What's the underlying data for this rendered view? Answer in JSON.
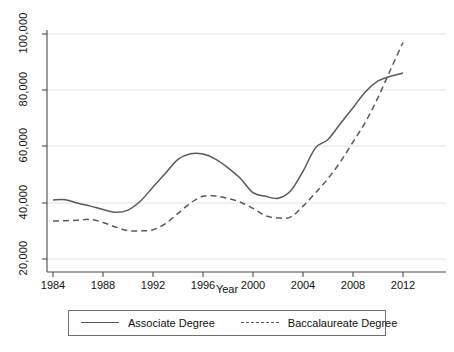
{
  "chart_data": {
    "type": "line",
    "title": "",
    "subtitle": "",
    "xlabel": "Year",
    "ylabel": "",
    "xlim": [
      1984,
      2012
    ],
    "ylim": [
      20000,
      100000
    ],
    "grid": true,
    "legend_position": "bottom",
    "x_ticks": [
      "1984",
      "1988",
      "1992",
      "1996",
      "2000",
      "2004",
      "2008",
      "2012"
    ],
    "x_tick_values": [
      1984,
      1988,
      1992,
      1996,
      2000,
      2004,
      2008,
      2012
    ],
    "y_ticks": [
      "20,000",
      "40,000",
      "60,000",
      "80,000",
      "100,000"
    ],
    "y_tick_values": [
      20000,
      40000,
      60000,
      80000,
      100000
    ],
    "x": [
      1984,
      1985,
      1986,
      1987,
      1988,
      1989,
      1990,
      1991,
      1992,
      1993,
      1994,
      1995,
      1996,
      1997,
      1998,
      1999,
      2000,
      2001,
      2002,
      2003,
      2004,
      2005,
      2006,
      2007,
      2008,
      2009,
      2010,
      2011,
      2012
    ],
    "series": [
      {
        "name": "Associate Degree",
        "style": "solid",
        "color": "#595959",
        "values": [
          41000,
          41100,
          39800,
          38800,
          37600,
          36600,
          37400,
          40600,
          45600,
          50500,
          55400,
          57400,
          57300,
          55500,
          52400,
          48600,
          43600,
          42300,
          41600,
          44200,
          51200,
          59500,
          62500,
          68200,
          73800,
          79500,
          83300,
          85000,
          86100
        ]
      },
      {
        "name": "Baccalaureate Degree",
        "style": "dashed",
        "color": "#595959",
        "values": [
          33500,
          33600,
          33800,
          34100,
          33000,
          31400,
          30100,
          30000,
          30400,
          32600,
          36200,
          39900,
          42300,
          42400,
          41500,
          40200,
          38000,
          35400,
          34600,
          34900,
          38800,
          43500,
          48600,
          54600,
          61600,
          68700,
          77400,
          87300,
          97000
        ]
      }
    ]
  },
  "axes": {
    "y_axis_name": "y-axis",
    "x_axis_name": "x-axis"
  },
  "legend": {
    "entries": [
      {
        "label": "Associate Degree",
        "style": "solid"
      },
      {
        "label": "Baccalaureate Degree",
        "style": "dashed"
      }
    ]
  }
}
